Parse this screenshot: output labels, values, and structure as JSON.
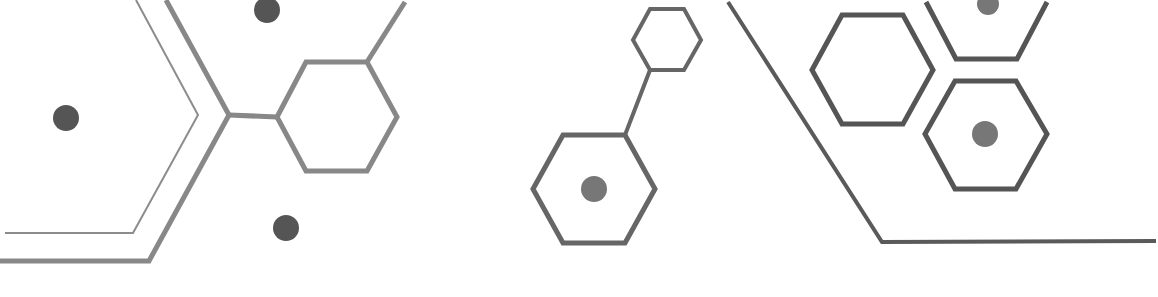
{
  "graphic": {
    "background": "#ffffff",
    "colors": {
      "line_light": "#8a8a8a",
      "line_mid": "#7a7a7a",
      "line_dark": "#555555",
      "dot_dark": "#555555",
      "dot_mid": "#777777"
    },
    "elements": {
      "chevron_thin": "thin-chevron-line",
      "chevron_thick": "thick-chevron-line",
      "hexagons": [
        "hexagon-left-large",
        "hexagon-center-small",
        "hexagon-center-large",
        "hexagon-right-top",
        "hexagon-right-upper",
        "hexagon-right-lower"
      ],
      "dots": [
        "dot-left",
        "dot-top",
        "dot-bottom",
        "dot-center-hex",
        "dot-right-top",
        "dot-right-lower"
      ],
      "bracket_line": "right-angled-bracket-line"
    }
  }
}
